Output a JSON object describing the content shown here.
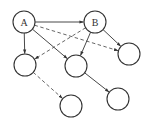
{
  "diagram": {
    "type": "directed-graph",
    "colors": {
      "stroke": "#333333",
      "fill": "#ffffff",
      "background": "#ffffff"
    },
    "node_radius": 11,
    "nodes": [
      {
        "id": "A",
        "label": "A",
        "x": 24,
        "y": 22
      },
      {
        "id": "B",
        "label": "B",
        "x": 95,
        "y": 22
      },
      {
        "id": "C",
        "label": "",
        "x": 25,
        "y": 65
      },
      {
        "id": "D",
        "label": "",
        "x": 76,
        "y": 66
      },
      {
        "id": "E",
        "label": "",
        "x": 129,
        "y": 54
      },
      {
        "id": "F",
        "label": "",
        "x": 71,
        "y": 106
      },
      {
        "id": "G",
        "label": "",
        "x": 118,
        "y": 99
      }
    ],
    "edges": [
      {
        "from": "A",
        "to": "B",
        "style": "solid"
      },
      {
        "from": "A",
        "to": "C",
        "style": "solid"
      },
      {
        "from": "A",
        "to": "D",
        "style": "solid"
      },
      {
        "from": "A",
        "to": "E",
        "style": "dashed"
      },
      {
        "from": "B",
        "to": "D",
        "style": "solid"
      },
      {
        "from": "B",
        "to": "E",
        "style": "solid"
      },
      {
        "from": "B",
        "to": "C",
        "style": "dashed"
      },
      {
        "from": "C",
        "to": "F",
        "style": "dashed"
      },
      {
        "from": "D",
        "to": "G",
        "style": "solid"
      }
    ]
  }
}
